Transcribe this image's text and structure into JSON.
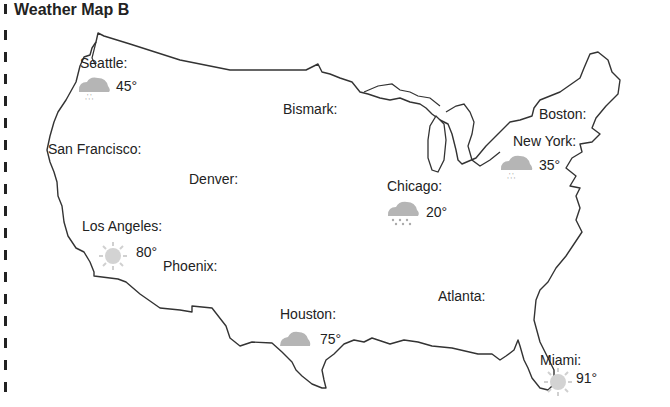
{
  "title": "Weather Map B",
  "cities": [
    {
      "name": "Seattle:",
      "temp": "45°",
      "icon": "rain-cloud-icon"
    },
    {
      "name": "San Francisco:",
      "temp": null,
      "icon": null
    },
    {
      "name": "Los Angeles:",
      "temp": "80°",
      "icon": "sun-icon"
    },
    {
      "name": "Phoenix:",
      "temp": null,
      "icon": null
    },
    {
      "name": "Denver:",
      "temp": null,
      "icon": null
    },
    {
      "name": "Bismark:",
      "temp": null,
      "icon": null
    },
    {
      "name": "Chicago:",
      "temp": "20°",
      "icon": "snow-cloud-icon"
    },
    {
      "name": "Houston:",
      "temp": "75°",
      "icon": "cloud-icon"
    },
    {
      "name": "Atlanta:",
      "temp": null,
      "icon": null
    },
    {
      "name": "Boston:",
      "temp": null,
      "icon": null
    },
    {
      "name": "New York:",
      "temp": "35°",
      "icon": "rain-cloud-icon"
    },
    {
      "name": "Miami:",
      "temp": "91°",
      "icon": "sun-icon"
    }
  ],
  "colors": {
    "outline": "#333333",
    "icon_gray": "#b5b5b5"
  }
}
